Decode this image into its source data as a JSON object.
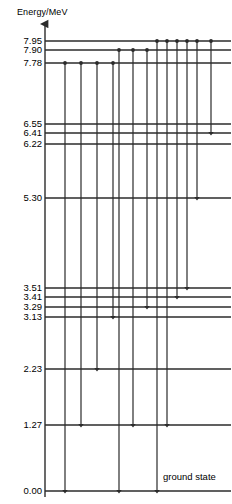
{
  "figure": {
    "axis_title": "Energy/MeV",
    "ground_state_label": "ground state",
    "line_color": "#2b2b2b",
    "text_color": "#000000"
  },
  "chart_data": {
    "type": "diagram",
    "title": "Energy/MeV",
    "ylabel": "Energy/MeV",
    "xlabel": "",
    "ylim": [
      0.0,
      8.35
    ],
    "grid": false,
    "legend": null,
    "annotations": [
      "ground state"
    ],
    "levels": [
      {
        "label": "7.95",
        "value": 7.95,
        "y": 41,
        "x_start": 45,
        "x_end": 231
      },
      {
        "label": "7.90",
        "value": 7.9,
        "y": 50,
        "x_start": 45,
        "x_end": 231
      },
      {
        "label": "7.78",
        "value": 7.78,
        "y": 63,
        "x_start": 45,
        "x_end": 231
      },
      {
        "label": "6.55",
        "value": 6.55,
        "y": 124,
        "x_start": 45,
        "x_end": 231
      },
      {
        "label": "6.41",
        "value": 6.41,
        "y": 133,
        "x_start": 45,
        "x_end": 231
      },
      {
        "label": "6.22",
        "value": 6.22,
        "y": 144,
        "x_start": 45,
        "x_end": 231
      },
      {
        "label": "5.30",
        "value": 5.3,
        "y": 198,
        "x_start": 45,
        "x_end": 231
      },
      {
        "label": "3.51",
        "value": 3.51,
        "y": 288,
        "x_start": 45,
        "x_end": 231
      },
      {
        "label": "3.41",
        "value": 3.41,
        "y": 297,
        "x_start": 45,
        "x_end": 231
      },
      {
        "label": "3.29",
        "value": 3.29,
        "y": 307,
        "x_start": 45,
        "x_end": 231
      },
      {
        "label": "3.13",
        "value": 3.13,
        "y": 317,
        "x_start": 45,
        "x_end": 231
      },
      {
        "label": "2.23",
        "value": 2.23,
        "y": 369,
        "x_start": 45,
        "x_end": 231
      },
      {
        "label": "1.27",
        "value": 1.27,
        "y": 425,
        "x_start": 45,
        "x_end": 231
      },
      {
        "label": "0.00",
        "value": 0.0,
        "y": 491,
        "x_start": 45,
        "x_end": 231
      }
    ],
    "transitions": [
      {
        "x": 65,
        "from": 7.78,
        "to": 0.0,
        "y_start": 63,
        "y_end": 491
      },
      {
        "x": 81,
        "from": 7.78,
        "to": 1.27,
        "y_start": 63,
        "y_end": 425
      },
      {
        "x": 97,
        "from": 7.78,
        "to": 2.23,
        "y_start": 63,
        "y_end": 369
      },
      {
        "x": 113,
        "from": 7.78,
        "to": 3.13,
        "y_start": 63,
        "y_end": 317
      },
      {
        "x": 119,
        "from": 7.9,
        "to": 0.0,
        "y_start": 50,
        "y_end": 491
      },
      {
        "x": 133,
        "from": 7.9,
        "to": 1.27,
        "y_start": 50,
        "y_end": 425
      },
      {
        "x": 147,
        "from": 7.9,
        "to": 3.29,
        "y_start": 50,
        "y_end": 307
      },
      {
        "x": 157,
        "from": 7.95,
        "to": 0.0,
        "y_start": 41,
        "y_end": 491
      },
      {
        "x": 167,
        "from": 7.95,
        "to": 1.27,
        "y_start": 41,
        "y_end": 425
      },
      {
        "x": 177,
        "from": 7.95,
        "to": 3.41,
        "y_start": 41,
        "y_end": 297
      },
      {
        "x": 187,
        "from": 7.95,
        "to": 3.51,
        "y_start": 41,
        "y_end": 288
      },
      {
        "x": 197,
        "from": 7.95,
        "to": 5.3,
        "y_start": 41,
        "y_end": 198
      },
      {
        "x": 211,
        "from": 7.95,
        "to": 6.41,
        "y_start": 41,
        "y_end": 133
      }
    ],
    "axis": {
      "x": 45,
      "y_top": 24,
      "y_bottom": 497,
      "arrow": "up"
    }
  }
}
